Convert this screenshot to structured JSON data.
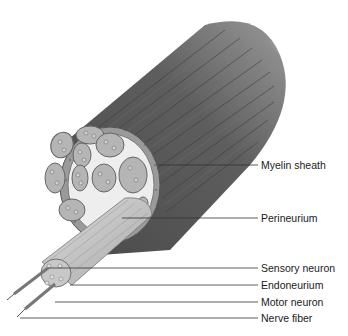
{
  "figure": {
    "colors": {
      "outer_bundle": "#5a5a5a",
      "outer_highlight": "#8a8a8a",
      "sheath_ring": "#9a9a9a",
      "cut_face": "#f0f0f0",
      "fascicle_fill": "#b8b8b8",
      "fascicle_edge": "#6a6a6a",
      "fiber_tube": "#c8c8c8",
      "leader_line": "#333333",
      "label_text": "#1a1a1a"
    }
  },
  "labels": [
    {
      "id": "myelin-sheath",
      "text": "Myelin sheath",
      "y": 159,
      "line_from_x": 168,
      "line_y": 165
    },
    {
      "id": "perineurium",
      "text": "Perineurium",
      "y": 212,
      "line_from_x": 122,
      "line_y": 218
    },
    {
      "id": "sensory-neuron",
      "text": "Sensory neuron",
      "y": 262,
      "line_from_x": 48,
      "line_y": 268
    },
    {
      "id": "endoneurium",
      "text": "Endoneurium",
      "y": 279,
      "line_from_x": 70,
      "line_y": 285
    },
    {
      "id": "motor-neuron",
      "text": "Motor neuron",
      "y": 296,
      "line_from_x": 55,
      "line_y": 302
    },
    {
      "id": "nerve-fiber",
      "text": "Nerve fiber",
      "y": 312,
      "line_from_x": 20,
      "line_y": 318
    }
  ]
}
